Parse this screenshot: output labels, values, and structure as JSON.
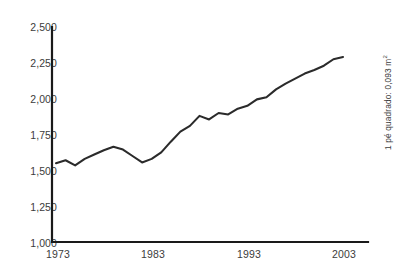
{
  "figure": {
    "side_note_text": "1 pé quadrado: 0,093 m",
    "side_note_superscript": "2"
  },
  "chart_data": {
    "type": "line",
    "title": "",
    "subtitle": "",
    "xlabel": "",
    "ylabel": "",
    "annotations": [
      "1 pé quadrado: 0,093 m²"
    ],
    "grid": false,
    "legend": null,
    "line_color": "#2b2b2b",
    "axis_color": "#1a1a1a",
    "xlim": [
      1973,
      2003
    ],
    "ylim": [
      1000,
      2500
    ],
    "xticks": [
      1973,
      1983,
      1993,
      2003
    ],
    "xtick_labels": [
      "1973",
      "1983",
      "1993",
      "2003"
    ],
    "yticks": [
      1000,
      1250,
      1500,
      1750,
      2000,
      2250,
      2500
    ],
    "ytick_labels": [
      "1,000",
      "1,250",
      "1,500",
      "1,750",
      "2,000",
      "2,250",
      "2,500"
    ],
    "x": [
      1973,
      1974,
      1975,
      1976,
      1977,
      1978,
      1979,
      1980,
      1981,
      1982,
      1983,
      1984,
      1985,
      1986,
      1987,
      1988,
      1989,
      1990,
      1991,
      1992,
      1993,
      1994,
      1995,
      1996,
      1997,
      1998,
      1999,
      2000,
      2001,
      2002,
      2003
    ],
    "values": [
      1550,
      1570,
      1535,
      1580,
      1610,
      1640,
      1665,
      1645,
      1600,
      1555,
      1580,
      1625,
      1700,
      1770,
      1810,
      1880,
      1855,
      1900,
      1890,
      1930,
      1950,
      1995,
      2010,
      2065,
      2105,
      2140,
      2175,
      2200,
      2230,
      2275,
      2290
    ],
    "series": [
      {
        "name": "",
        "values": [
          1550,
          1570,
          1535,
          1580,
          1610,
          1640,
          1665,
          1645,
          1600,
          1555,
          1580,
          1625,
          1700,
          1770,
          1810,
          1880,
          1855,
          1900,
          1890,
          1930,
          1950,
          1995,
          2010,
          2065,
          2105,
          2140,
          2175,
          2200,
          2230,
          2275,
          2290
        ]
      }
    ]
  }
}
